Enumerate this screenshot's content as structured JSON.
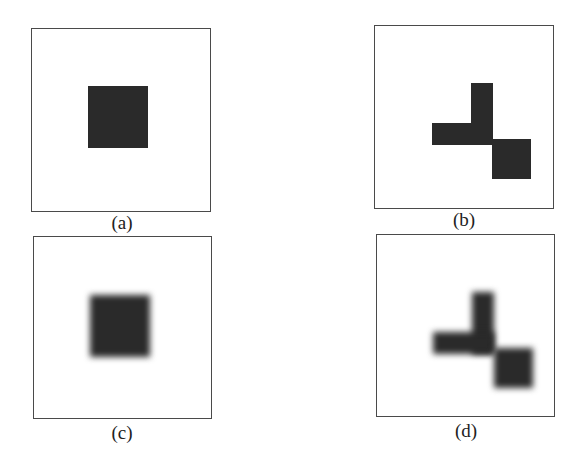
{
  "figure": {
    "panels": [
      {
        "id": "a",
        "caption": "(a)",
        "description": "Single sharp dark square centered in frame"
      },
      {
        "id": "b",
        "caption": "(b)",
        "description": "Sharp Z-like shape: L-shaped bar plus offset square"
      },
      {
        "id": "c",
        "caption": "(c)",
        "description": "Blurred version of the square in (a)"
      },
      {
        "id": "d",
        "caption": "(d)",
        "description": "Blurred version of the shape in (b)"
      }
    ],
    "colors": {
      "shape": "#2a2a2a",
      "frame": "#4a4a4a",
      "background": "#ffffff"
    }
  }
}
